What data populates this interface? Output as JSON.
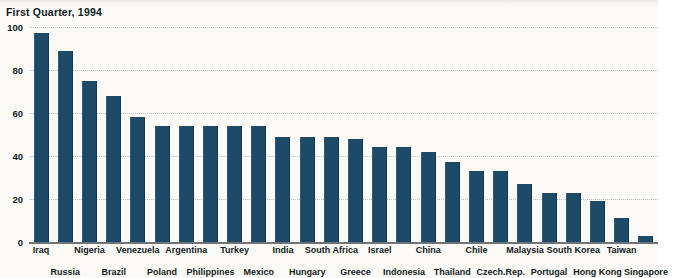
{
  "chart_data": {
    "type": "bar",
    "title": "First Quarter, 1994",
    "xlabel": "",
    "ylabel": "",
    "ylim": [
      0,
      100
    ],
    "yticks": [
      0,
      20,
      40,
      60,
      80,
      100
    ],
    "grid": true,
    "legend": false,
    "bar_color": "#1d4a66",
    "background_color": "#fbfaf7",
    "categories": [
      "Iraq",
      "Russia",
      "Nigeria",
      "Brazil",
      "Venezuela",
      "Poland",
      "Argentina",
      "Philippines",
      "Turkey",
      "Mexico",
      "India",
      "Hungary",
      "South Africa",
      "Greece",
      "Israel",
      "Indonesia",
      "China",
      "Thailand",
      "Chile",
      "Czech.Rep.",
      "Malaysia",
      "Portugal",
      "South Korea",
      "Hong Kong",
      "Taiwan",
      "Singapore"
    ],
    "values": [
      97,
      89,
      75,
      68,
      58,
      54,
      54,
      54,
      54,
      54,
      49,
      49,
      49,
      48,
      44,
      44,
      42,
      37,
      33,
      33,
      27,
      23,
      23,
      19,
      11,
      3
    ]
  }
}
